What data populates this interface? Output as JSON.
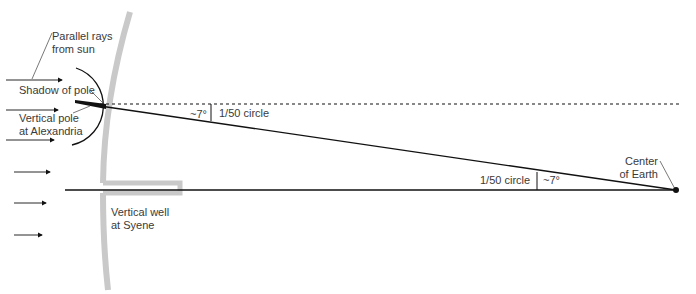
{
  "diagram": {
    "labels": {
      "parallel_rays_line1": "Parallel rays",
      "parallel_rays_line2": "from sun",
      "shadow_of_pole": "Shadow of pole",
      "vertical_pole_line1": "Vertical pole",
      "vertical_pole_line2": "at Alexandria",
      "angle_top": "~7°",
      "fraction_top": "1/50 circle",
      "fraction_bottom": "1/50 circle",
      "angle_bottom": "~7°",
      "center_line1": "Center",
      "center_line2": "of Earth",
      "well_line1": "Vertical well",
      "well_line2": "at Syene"
    },
    "colors": {
      "line": "#111111",
      "earth_surface": "#c8c8c8",
      "text": "#3a3a3a"
    },
    "sun_rays": [
      {
        "y": 80,
        "x1": 6,
        "x2": 62
      },
      {
        "y": 110,
        "x1": 6,
        "x2": 58
      },
      {
        "y": 140,
        "x1": 6,
        "x2": 54
      },
      {
        "y": 172,
        "x1": 14,
        "x2": 50
      },
      {
        "y": 203,
        "x1": 14,
        "x2": 46
      },
      {
        "y": 235,
        "x1": 14,
        "x2": 42
      }
    ],
    "angle_degrees": 7,
    "fraction_of_circle": "1/50"
  }
}
